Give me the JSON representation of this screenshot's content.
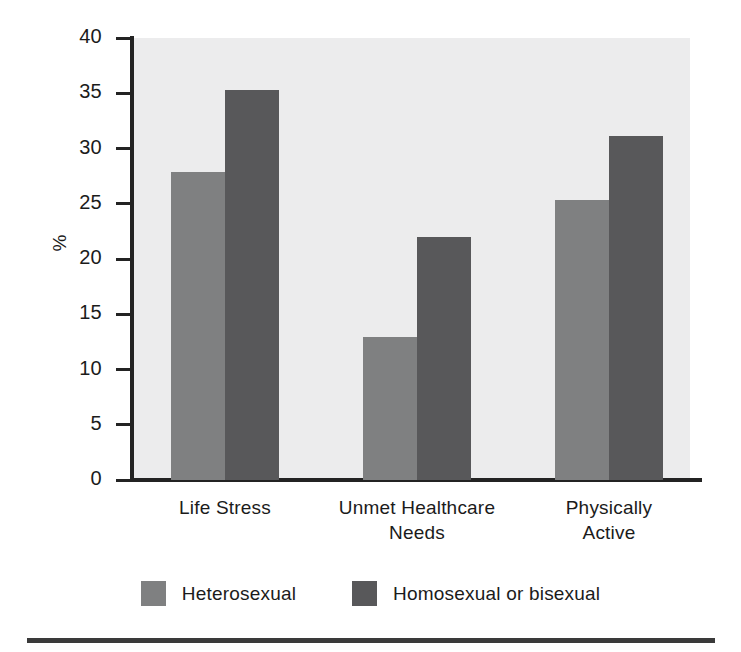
{
  "chart_data": {
    "type": "bar",
    "title": "",
    "subtitle": "",
    "xlabel": "",
    "ylabel": "%",
    "categories": [
      "Life Stress",
      "Unmet Healthcare Needs",
      "Physically Active"
    ],
    "category_lines": [
      [
        "Life Stress"
      ],
      [
        "Unmet Healthcare",
        "Needs"
      ],
      [
        "Physically",
        "Active"
      ]
    ],
    "series": [
      {
        "name": "Heterosexual",
        "color": "#7f8081",
        "values": [
          27.9,
          12.9,
          25.3
        ]
      },
      {
        "name": "Homosexual or bisexual",
        "color": "#58585a",
        "values": [
          35.3,
          22.0,
          31.1
        ]
      }
    ],
    "ylim": [
      0,
      40
    ],
    "yticks": [
      0,
      5,
      10,
      15,
      20,
      25,
      30,
      35,
      40
    ],
    "ytick_labels": [
      "0",
      "5",
      "10",
      "15",
      "20",
      "25",
      "30",
      "35",
      "40"
    ],
    "grid": false,
    "legend_position": "bottom",
    "plot_background": "#ececed",
    "axis_color": "#232323",
    "text_color": "#1b1b1b"
  },
  "legend": {
    "items": [
      {
        "label": "Heterosexual",
        "swatch": "light"
      },
      {
        "label": "Homosexual or bisexual",
        "swatch": "dark"
      }
    ]
  },
  "footer": {
    "rule_color": "#3a3a3a"
  }
}
